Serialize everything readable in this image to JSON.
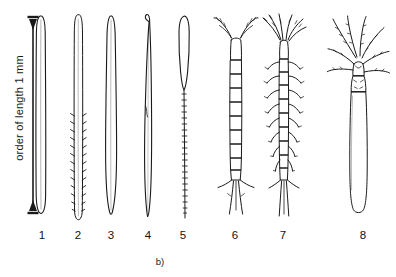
{
  "figure": {
    "panel_caption": "b)",
    "scale": {
      "label": "order of length 1 mm",
      "arrow_name": "double-headed-vertical-arrow",
      "value": 1,
      "unit": "mm"
    },
    "stroke_color": "#1a1a1a",
    "background_color": "#ffffff",
    "specimens": [
      {
        "number": "1",
        "name": "slender-smooth-worm",
        "x": 42,
        "description": "very slender smooth elongate worm, rounded ends"
      },
      {
        "number": "2",
        "name": "bristled-worm",
        "x": 78,
        "description": "slender worm with paired lateral bristles along lower half"
      },
      {
        "number": "3",
        "name": "tapered-smooth-worm",
        "x": 111,
        "description": "smooth worm, slightly swollen mid-body, tapered tip"
      },
      {
        "number": "4",
        "name": "hook-headed-worm",
        "x": 148,
        "description": "slender worm with small hook/loop at anterior end"
      },
      {
        "number": "5",
        "name": "beaded-tail-worm",
        "x": 183,
        "description": "broad rounded head narrowing to beaded segmented tail"
      },
      {
        "number": "6",
        "name": "segmented-crustacean",
        "x": 235,
        "description": "segmented body, two antennae, caudal furca"
      },
      {
        "number": "7",
        "name": "many-legged-arthropod",
        "x": 283,
        "description": "segmented arthropod with many paired legs and long antennae"
      },
      {
        "number": "8",
        "name": "tube-body-crowned-organism",
        "x": 363,
        "description": "thick cylindrical body with crown of spreading appendages"
      }
    ]
  }
}
